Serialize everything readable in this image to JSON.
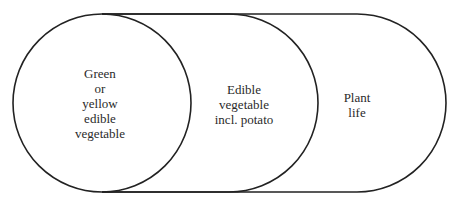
{
  "diagram": {
    "type": "nested-sets",
    "stroke_color": "#222222",
    "background": "#ffffff",
    "sets": [
      {
        "id": "green-yellow-vegetable",
        "shape": "circle",
        "lines": [
          "Green",
          "or",
          "yellow",
          "edible",
          "vegetable"
        ]
      },
      {
        "id": "edible-vegetable",
        "shape": "stadium",
        "lines": [
          "Edible",
          "vegetable",
          "incl. potato"
        ]
      },
      {
        "id": "plant-life",
        "shape": "stadium",
        "lines": [
          "Plant",
          "life"
        ]
      }
    ]
  }
}
